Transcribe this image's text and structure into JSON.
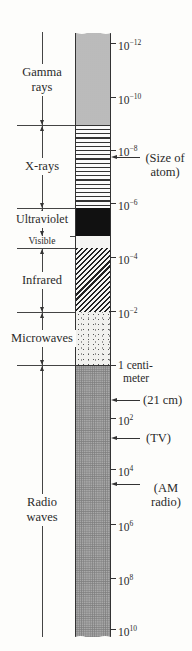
{
  "diagram": {
    "bands": [
      {
        "id": "gamma",
        "label_lines": [
          "Gamma",
          "rays"
        ],
        "fill": "fine gray stipple",
        "color": "#c4c4c4"
      },
      {
        "id": "xray",
        "label_lines": [
          "X-rays"
        ],
        "fill": "horizontal lines",
        "color": "#333333"
      },
      {
        "id": "uv",
        "label_lines": [
          "Ultraviolet"
        ],
        "fill": "solid black",
        "color": "#111111"
      },
      {
        "id": "visible",
        "label_lines": [
          "Visible"
        ],
        "fill": "white",
        "color": "#f6f6f4"
      },
      {
        "id": "ir",
        "label_lines": [
          "Infrared"
        ],
        "fill": "diagonal hatch",
        "color": "#222222"
      },
      {
        "id": "micro",
        "label_lines": [
          "Microwaves"
        ],
        "fill": "sparse dots",
        "color": "#f1f1ee"
      },
      {
        "id": "radio",
        "label_lines": [
          "Radio",
          "waves"
        ],
        "fill": "dark stipple",
        "color": "#a9a9a9"
      }
    ],
    "ticks": [
      {
        "base": "10",
        "exp": "−12"
      },
      {
        "base": "10",
        "exp": "−10"
      },
      {
        "base": "10",
        "exp": "−8"
      },
      {
        "base": "10",
        "exp": "−6"
      },
      {
        "base": "10",
        "exp": "−4"
      },
      {
        "base": "10",
        "exp": "−2"
      },
      {
        "line1": "1 centi-",
        "line2": "meter"
      },
      {
        "base": "10",
        "exp": "2"
      },
      {
        "base": "10",
        "exp": "4"
      },
      {
        "base": "10",
        "exp": "6"
      },
      {
        "base": "10",
        "exp": "8"
      },
      {
        "base": "10",
        "exp": "10"
      }
    ],
    "annotations": [
      {
        "id": "atom",
        "line1": "(Size of",
        "line2": "atom)"
      },
      {
        "id": "21cm",
        "line1": "(21 cm)"
      },
      {
        "id": "tv",
        "line1": "(TV)"
      },
      {
        "id": "am",
        "line1": "(AM",
        "line2": "radio)"
      }
    ]
  }
}
